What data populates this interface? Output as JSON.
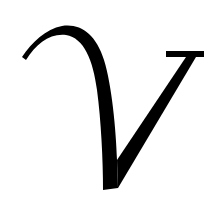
{
  "glyph": {
    "letter": "V",
    "style": "calligraphic italic",
    "fill_color": "#000000",
    "background_color": "#ffffff"
  }
}
